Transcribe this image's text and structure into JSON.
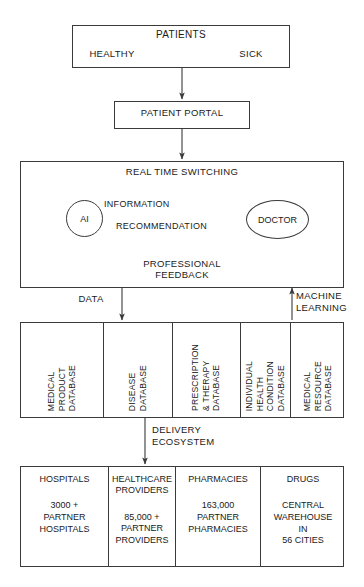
{
  "diagram": {
    "patients": {
      "title": "PATIENTS",
      "healthy": "HEALTHY",
      "sick": "SICK"
    },
    "portal": {
      "label": "PATIENT PORTAL"
    },
    "switching": {
      "top_label": "REAL TIME SWITCHING",
      "ai_label": "AI",
      "doctor_label": "DOCTOR",
      "information_label": "INFORMATION",
      "recommendation_label": "RECOMMENDATION",
      "feedback_label": "PROFESSIONAL\nFEEDBACK"
    },
    "flows": {
      "data_label": "DATA",
      "machine_learning_label": "MACHINE\nLEARNING",
      "delivery_label": "DELIVERY\nECOSYSTEM"
    },
    "databases": [
      {
        "label": "MEDICAL\nPRODUCT\nDATABASE",
        "width": 83
      },
      {
        "label": "DISEASE\nDATABASE",
        "width": 69
      },
      {
        "label": "PRESCRIPTION\n& THERAPY\nDATABASE",
        "width": 68
      },
      {
        "label": "INDIVIDUAL\nHEALTH\nCONDITION\nDATABASE",
        "width": 50
      },
      {
        "label": "MEDICAL\nRESOURCE\nDATABASE",
        "width": 54
      }
    ],
    "ecosystem": [
      {
        "heading": "HOSPITALS",
        "body": "3000 +\nPARTNER\nHOSPITALS",
        "width": 88
      },
      {
        "heading": "HEALTHCARE\nPROVIDERS",
        "body": "85,000 +\nPARTNER\nPROVIDERS",
        "width": 67
      },
      {
        "heading": "PHARMACIES",
        "body": "163,000\nPARTNER\nPHARMACIES",
        "width": 85
      },
      {
        "heading": "DRUGS",
        "body": "CENTRAL\nWAREHOUSE\nIN\n56 CITIES",
        "width": 84
      }
    ],
    "colors": {
      "stroke": "#3a3a3a",
      "text": "#1a1a1a",
      "background": "#ffffff"
    }
  }
}
